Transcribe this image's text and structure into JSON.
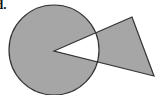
{
  "label": "d.",
  "diagram": {
    "fill_color": "#a6a6a6",
    "stroke_color": "#333333",
    "background": "#ffffff",
    "circle": {
      "cx": 54,
      "cy": 50,
      "r": 45
    },
    "triangle": {
      "points": [
        [
          54,
          51
        ],
        [
          132,
          17
        ],
        [
          154,
          76
        ]
      ]
    }
  }
}
